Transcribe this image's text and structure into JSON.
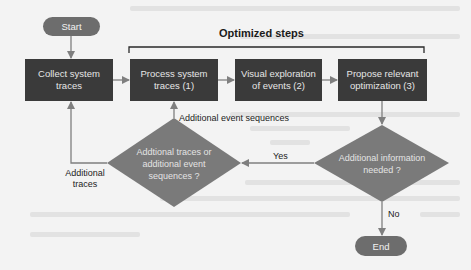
{
  "diagram": {
    "title": "Optimized steps",
    "start": "Start",
    "end": "End",
    "steps": [
      {
        "id": "collect",
        "label": "Collect system traces"
      },
      {
        "id": "process",
        "label": "Process system traces (1)"
      },
      {
        "id": "visual",
        "label": "Visual exploration of events (2)"
      },
      {
        "id": "propose",
        "label": "Propose relevant optimization (3)"
      }
    ],
    "decisions": [
      {
        "id": "info",
        "label": "Additional information needed ?"
      },
      {
        "id": "traces",
        "label": "Addtional traces or additional event sequences ?"
      }
    ],
    "edge_labels": {
      "yes": "Yes",
      "no": "No",
      "additional_event_sequences": "Additional event sequences",
      "additional_traces": "Additional traces"
    },
    "colors": {
      "box": "#3a3a3a",
      "diamond": "#7a7a7a",
      "pill": "#6d6d6d",
      "arrow": "#7f7f7f",
      "background": "#f3f3f3"
    }
  }
}
